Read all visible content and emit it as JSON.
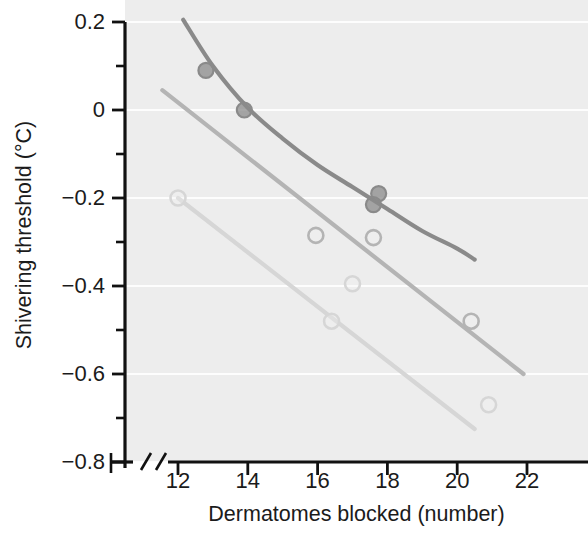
{
  "chart_data": {
    "type": "scatter",
    "title": "",
    "xlabel": "Dermatomes blocked (number)",
    "ylabel": "Shivering threshold (°C)",
    "xlim": [
      10.6,
      23.3
    ],
    "ylim": [
      -0.8,
      0.2
    ],
    "xticks": [
      12,
      14,
      16,
      18,
      20,
      22
    ],
    "xtick_labels": [
      "12",
      "14",
      "16",
      "18",
      "20",
      "22"
    ],
    "yticks": [
      0.2,
      0,
      -0.2,
      -0.4,
      -0.6,
      -0.8
    ],
    "ytick_labels": [
      "0.2",
      "0",
      "−0.2",
      "−0.4",
      "−0.6",
      "−0.8"
    ],
    "yminorticks": [
      0.1,
      -0.1,
      -0.3,
      -0.5,
      -0.7
    ],
    "grid": "horizontal-major-white",
    "axis_break_x": true,
    "plot_background": "#ededed",
    "gridline_color": "#fdfdfd",
    "axis_color": "#111111",
    "legend": "none",
    "series": [
      {
        "name": "dark-gray-series",
        "color": "#8a8a8a",
        "marker": "filled-circle",
        "points": [
          {
            "x": 12.8,
            "y": 0.09
          },
          {
            "x": 13.9,
            "y": 0.0
          },
          {
            "x": 17.75,
            "y": -0.19
          },
          {
            "x": 17.6,
            "y": -0.215
          }
        ],
        "fit_curve": {
          "shape": "curved",
          "points": [
            {
              "x": 12.15,
              "y": 0.205
            },
            {
              "x": 13.0,
              "y": 0.1
            },
            {
              "x": 14.0,
              "y": 0.005
            },
            {
              "x": 15.0,
              "y": -0.065
            },
            {
              "x": 16.0,
              "y": -0.125
            },
            {
              "x": 17.0,
              "y": -0.175
            },
            {
              "x": 18.0,
              "y": -0.225
            },
            {
              "x": 19.0,
              "y": -0.275
            },
            {
              "x": 20.0,
              "y": -0.315
            },
            {
              "x": 20.5,
              "y": -0.34
            }
          ]
        }
      },
      {
        "name": "medium-gray-series",
        "color": "#b4b4b4",
        "marker": "open-circle",
        "points": [
          {
            "x": 15.95,
            "y": -0.285
          },
          {
            "x": 17.6,
            "y": -0.29
          },
          {
            "x": 20.4,
            "y": -0.48
          }
        ],
        "fit_curve": {
          "shape": "straight",
          "points": [
            {
              "x": 11.55,
              "y": 0.045
            },
            {
              "x": 21.9,
              "y": -0.6
            }
          ]
        }
      },
      {
        "name": "light-gray-series",
        "color": "#d6d6d6",
        "marker": "open-circle",
        "points": [
          {
            "x": 12.0,
            "y": -0.2
          },
          {
            "x": 16.4,
            "y": -0.48
          },
          {
            "x": 17.0,
            "y": -0.395
          },
          {
            "x": 20.9,
            "y": -0.67
          }
        ],
        "fit_curve": {
          "shape": "straight",
          "points": [
            {
              "x": 12.0,
              "y": -0.2
            },
            {
              "x": 20.5,
              "y": -0.725
            }
          ]
        }
      }
    ]
  }
}
